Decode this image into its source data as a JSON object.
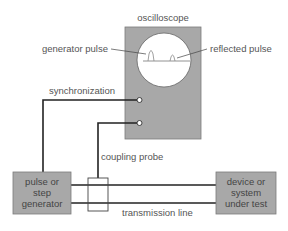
{
  "diagram": {
    "type": "time-domain-reflectometry setup",
    "colors": {
      "box_fill": "#a8a8a8",
      "box_stroke": "#777777",
      "screen_fill": "#ffffff",
      "wire": "#222222",
      "label": "#555555"
    },
    "labels": {
      "oscilloscope": "oscilloscope",
      "generator_pulse": "generator pulse",
      "reflected_pulse": "reflected pulse",
      "synchronization": "synchronization",
      "coupling_probe": "coupling probe",
      "transmission_line": "transmission line"
    },
    "boxes": {
      "generator": {
        "lines": [
          "pulse or",
          "step",
          "generator"
        ]
      },
      "device": {
        "lines": [
          "device or",
          "system",
          "under test"
        ]
      }
    }
  }
}
